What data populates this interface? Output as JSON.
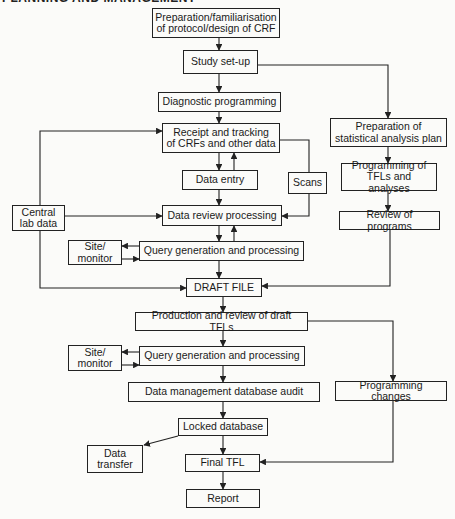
{
  "header": {
    "text": "PLANNING AND MANAGEMENT"
  },
  "diagram": {
    "type": "flowchart",
    "nodes": {
      "prep_protocol": {
        "lines": [
          "Preparation/familiarisation",
          "of protocol/design of CRF"
        ]
      },
      "study_setup": {
        "lines": [
          "Study set-up"
        ]
      },
      "diagnostic_programming": {
        "lines": [
          "Diagnostic programming"
        ]
      },
      "receipt_tracking": {
        "lines": [
          "Receipt and tracking",
          "of CRFs and other data"
        ]
      },
      "data_entry": {
        "lines": [
          "Data entry"
        ]
      },
      "scans": {
        "lines": [
          "Scans"
        ]
      },
      "central_lab": {
        "lines": [
          "Central",
          "lab data"
        ]
      },
      "data_review": {
        "lines": [
          "Data review processing"
        ]
      },
      "site_monitor_1": {
        "lines": [
          "Site/",
          "monitor"
        ]
      },
      "query_gen_1": {
        "lines": [
          "Query generation and processing"
        ]
      },
      "draft_file": {
        "lines": [
          "DRAFT FILE"
        ]
      },
      "prep_sap": {
        "lines": [
          "Preparation of",
          "statistical analysis plan"
        ]
      },
      "programming_tfls": {
        "lines": [
          "Programming of",
          "TFLs and analyses"
        ]
      },
      "review_programs": {
        "lines": [
          "Review of programs"
        ]
      },
      "production_review": {
        "lines": [
          "Production and review of draft TFLs"
        ]
      },
      "site_monitor_2": {
        "lines": [
          "Site/",
          "monitor"
        ]
      },
      "query_gen_2": {
        "lines": [
          "Query generation and processing"
        ]
      },
      "dm_audit": {
        "lines": [
          "Data management database audit"
        ]
      },
      "programming_changes": {
        "lines": [
          "Programming changes"
        ]
      },
      "locked_db": {
        "lines": [
          "Locked database"
        ]
      },
      "data_transfer": {
        "lines": [
          "Data",
          "transfer"
        ]
      },
      "final_tfl": {
        "lines": [
          "Final TFL"
        ]
      },
      "report": {
        "lines": [
          "Report"
        ]
      }
    },
    "edges": [
      [
        "prep_protocol",
        "study_setup"
      ],
      [
        "study_setup",
        "diagnostic_programming"
      ],
      [
        "study_setup",
        "prep_sap"
      ],
      [
        "diagnostic_programming",
        "receipt_tracking"
      ],
      [
        "receipt_tracking",
        "data_entry"
      ],
      [
        "data_entry",
        "receipt_tracking"
      ],
      [
        "receipt_tracking",
        "scans"
      ],
      [
        "scans",
        "data_review"
      ],
      [
        "data_entry",
        "data_review"
      ],
      [
        "central_lab",
        "receipt_tracking"
      ],
      [
        "central_lab",
        "data_review"
      ],
      [
        "central_lab",
        "draft_file"
      ],
      [
        "data_review",
        "query_gen_1"
      ],
      [
        "query_gen_1",
        "data_review"
      ],
      [
        "query_gen_1",
        "site_monitor_1"
      ],
      [
        "site_monitor_1",
        "query_gen_1"
      ],
      [
        "query_gen_1",
        "draft_file"
      ],
      [
        "prep_sap",
        "programming_tfls"
      ],
      [
        "programming_tfls",
        "review_programs"
      ],
      [
        "review_programs",
        "draft_file"
      ],
      [
        "draft_file",
        "production_review"
      ],
      [
        "production_review",
        "query_gen_2"
      ],
      [
        "production_review",
        "programming_changes"
      ],
      [
        "query_gen_2",
        "site_monitor_2"
      ],
      [
        "site_monitor_2",
        "query_gen_2"
      ],
      [
        "query_gen_2",
        "dm_audit"
      ],
      [
        "dm_audit",
        "locked_db"
      ],
      [
        "locked_db",
        "data_transfer"
      ],
      [
        "locked_db",
        "final_tfl"
      ],
      [
        "programming_changes",
        "final_tfl"
      ],
      [
        "final_tfl",
        "report"
      ]
    ],
    "line_color": "#222222",
    "background": "#fbfbf9"
  }
}
